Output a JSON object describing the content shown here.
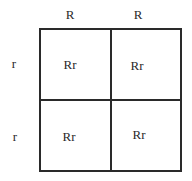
{
  "punnett_square": {
    "columns": [
      "R",
      "R"
    ],
    "rows": [
      "r",
      "r"
    ],
    "cells": [
      [
        "Rr",
        "Rr"
      ],
      [
        "Rr",
        "Rr"
      ]
    ]
  }
}
